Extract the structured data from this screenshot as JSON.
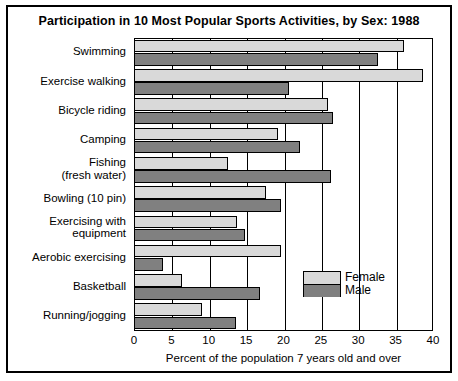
{
  "chart_data": {
    "type": "bar",
    "orientation": "horizontal",
    "title": "Participation in 10 Most Popular Sports Activities, by Sex: 1988",
    "xlabel": "Percent of the population 7 years old and over",
    "ylabel": "",
    "xlim": [
      0,
      40
    ],
    "xticks": [
      0,
      5,
      10,
      15,
      20,
      25,
      30,
      35,
      40
    ],
    "xtick_labels": [
      "0",
      "5",
      "10",
      "15",
      "20",
      "25",
      "30",
      "35",
      "40"
    ],
    "grid": true,
    "legend_position": "inside-right-lower",
    "categories": [
      "Swimming",
      "Exercise walking",
      "Bicycle riding",
      "Camping",
      "Fishing\n(fresh water)",
      "Bowling (10 pin)",
      "Exercising with\nequipment",
      "Aerobic exercising",
      "Basketball",
      "Running/jogging"
    ],
    "category_lines": [
      [
        "Swimming"
      ],
      [
        "Exercise walking"
      ],
      [
        "Bicycle riding"
      ],
      [
        "Camping"
      ],
      [
        "Fishing",
        "(fresh water)"
      ],
      [
        "Bowling (10 pin)"
      ],
      [
        "Exercising with",
        "equipment"
      ],
      [
        "Aerobic exercising"
      ],
      [
        "Basketball"
      ],
      [
        "Running/jogging"
      ]
    ],
    "series": [
      {
        "name": "Female",
        "color": "#d9d9d9",
        "values": [
          36.1,
          38.6,
          26.0,
          19.2,
          12.6,
          17.6,
          13.8,
          19.6,
          6.4,
          9.1
        ]
      },
      {
        "name": "Male",
        "color": "#808080",
        "values": [
          32.6,
          20.7,
          26.6,
          22.2,
          26.4,
          19.6,
          14.9,
          3.9,
          16.9,
          13.6
        ]
      }
    ]
  },
  "legend": {
    "female_label": "Female",
    "male_label": "Male"
  }
}
